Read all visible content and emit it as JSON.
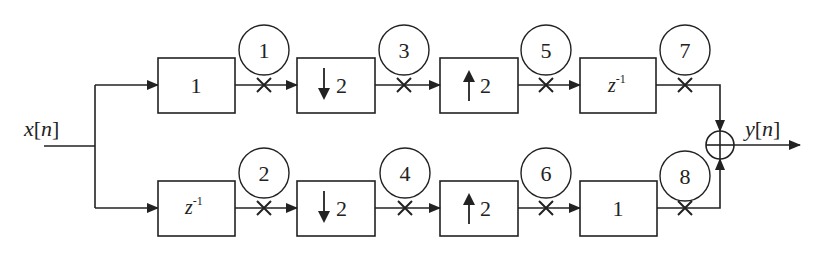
{
  "input_label": {
    "var": "x",
    "idx": "n"
  },
  "output_label": {
    "var": "y",
    "idx": "n"
  },
  "top_branch": {
    "blocks": [
      {
        "type": "gain",
        "label": "1"
      },
      {
        "type": "downsample",
        "label": "2"
      },
      {
        "type": "upsample",
        "label": "2"
      },
      {
        "type": "delay",
        "base": "z",
        "exp": "-1"
      }
    ],
    "probes": [
      "1",
      "3",
      "5",
      "7"
    ]
  },
  "bottom_branch": {
    "blocks": [
      {
        "type": "delay",
        "base": "z",
        "exp": "-1"
      },
      {
        "type": "downsample",
        "label": "2"
      },
      {
        "type": "upsample",
        "label": "2"
      },
      {
        "type": "gain",
        "label": "1"
      }
    ],
    "probes": [
      "2",
      "4",
      "6",
      "8"
    ]
  },
  "summer": {
    "symbol": "plus-circle"
  },
  "colors": {
    "stroke": "#222222",
    "background": "#ffffff"
  }
}
